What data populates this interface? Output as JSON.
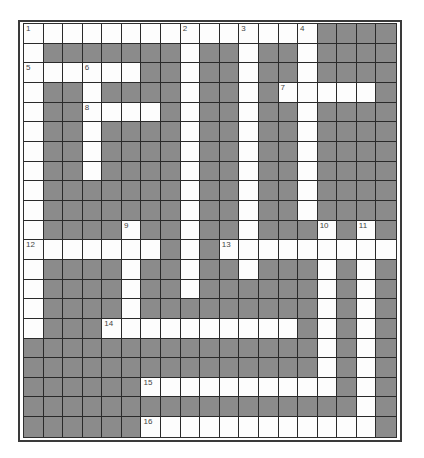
{
  "puzzle": {
    "rows": 21,
    "cols": 19,
    "colors": {
      "block": "#8b8b8b",
      "open": "#fdfdfd",
      "line": "#2a2a2a",
      "number": "#444444"
    },
    "open_cells": {
      "0": [
        0,
        1,
        2,
        3,
        4,
        5,
        6,
        7,
        8,
        9,
        10,
        11,
        12,
        13,
        14
      ],
      "1": [
        0,
        8,
        11,
        14
      ],
      "2": [
        0,
        1,
        2,
        3,
        4,
        5,
        8,
        11,
        14
      ],
      "3": [
        0,
        3,
        8,
        11,
        13,
        14,
        15,
        16,
        17
      ],
      "4": [
        0,
        3,
        4,
        5,
        6,
        8,
        11,
        14
      ],
      "5": [
        0,
        3,
        8,
        11,
        14
      ],
      "6": [
        0,
        3,
        8,
        11,
        14
      ],
      "7": [
        0,
        3,
        8,
        11,
        14
      ],
      "8": [
        0,
        8,
        11,
        14
      ],
      "9": [
        0,
        8,
        11,
        14
      ],
      "10": [
        0,
        5,
        8,
        11,
        15,
        17
      ],
      "11": [
        0,
        1,
        2,
        3,
        4,
        5,
        6,
        8,
        10,
        11,
        12,
        13,
        14,
        15,
        16,
        17,
        18
      ],
      "12": [
        0,
        5,
        8,
        11,
        15,
        17
      ],
      "13": [
        0,
        5,
        8,
        15,
        17
      ],
      "14": [
        0,
        5,
        15,
        17
      ],
      "15": [
        0,
        4,
        5,
        6,
        7,
        8,
        9,
        10,
        11,
        12,
        13,
        15,
        17
      ],
      "16": [
        15,
        17
      ],
      "17": [
        15,
        17
      ],
      "18": [
        6,
        7,
        8,
        9,
        10,
        11,
        12,
        13,
        14,
        15,
        17
      ],
      "19": [
        17
      ],
      "20": [
        6,
        7,
        8,
        9,
        10,
        11,
        12,
        13,
        14,
        15,
        16,
        17
      ]
    },
    "numbers": [
      {
        "label": "1",
        "row": 0,
        "col": 0
      },
      {
        "label": "2",
        "row": 0,
        "col": 8
      },
      {
        "label": "3",
        "row": 0,
        "col": 11
      },
      {
        "label": "4",
        "row": 0,
        "col": 14
      },
      {
        "label": "5",
        "row": 2,
        "col": 0
      },
      {
        "label": "6",
        "row": 2,
        "col": 3
      },
      {
        "label": "7",
        "row": 3,
        "col": 13
      },
      {
        "label": "8",
        "row": 4,
        "col": 3
      },
      {
        "label": "9",
        "row": 10,
        "col": 5
      },
      {
        "label": "10",
        "row": 10,
        "col": 15
      },
      {
        "label": "11",
        "row": 10,
        "col": 17
      },
      {
        "label": "12",
        "row": 11,
        "col": 0
      },
      {
        "label": "13",
        "row": 11,
        "col": 10
      },
      {
        "label": "14",
        "row": 15,
        "col": 4
      },
      {
        "label": "15",
        "row": 18,
        "col": 6
      },
      {
        "label": "16",
        "row": 20,
        "col": 6
      }
    ],
    "entries": [
      {
        "number": "1",
        "direction": "across",
        "length": 15
      },
      {
        "number": "1",
        "direction": "down",
        "length": 16
      },
      {
        "number": "2",
        "direction": "down",
        "length": 14
      },
      {
        "number": "3",
        "direction": "down",
        "length": 13
      },
      {
        "number": "4",
        "direction": "down",
        "length": 10
      },
      {
        "number": "5",
        "direction": "across",
        "length": 6
      },
      {
        "number": "6",
        "direction": "down",
        "length": 6
      },
      {
        "number": "7",
        "direction": "across",
        "length": 5
      },
      {
        "number": "8",
        "direction": "across",
        "length": 4
      },
      {
        "number": "9",
        "direction": "down",
        "length": 6
      },
      {
        "number": "10",
        "direction": "down",
        "length": 9
      },
      {
        "number": "11",
        "direction": "down",
        "length": 11
      },
      {
        "number": "12",
        "direction": "across",
        "length": 7
      },
      {
        "number": "13",
        "direction": "across",
        "length": 9
      },
      {
        "number": "14",
        "direction": "across",
        "length": 10
      },
      {
        "number": "15",
        "direction": "across",
        "length": 10
      },
      {
        "number": "16",
        "direction": "across",
        "length": 12
      }
    ]
  }
}
